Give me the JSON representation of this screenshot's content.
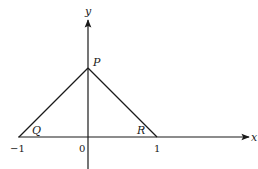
{
  "diagram": {
    "type": "coordinate-axes-triangle",
    "axes": {
      "x_label": "x",
      "y_label": "y"
    },
    "ticks": {
      "neg_one": "−1",
      "origin": "0",
      "one": "1"
    },
    "points": {
      "P": "P",
      "Q": "Q",
      "R": "R"
    },
    "colors": {
      "stroke": "#1a1a1a",
      "background": "#ffffff"
    }
  }
}
